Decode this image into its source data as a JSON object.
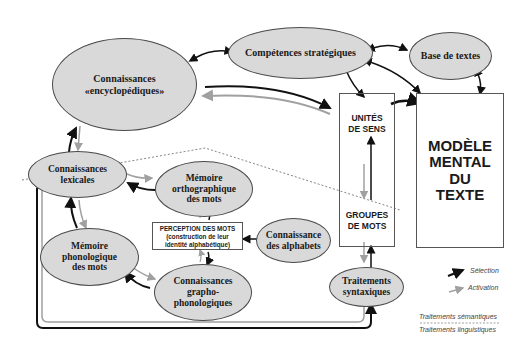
{
  "nodes": {
    "encyclopedic": {
      "line1": "Connaissances",
      "line2": "«encyclopédiques»"
    },
    "strategic": {
      "label": "Compétences stratégiques"
    },
    "text_base": {
      "label": "Base de textes"
    },
    "lexical": {
      "line1": "Connaissances",
      "line2": "lexicales"
    },
    "ortho_memory": {
      "line1": "Mémoire",
      "line2": "orthographique",
      "line3": "des mots"
    },
    "phono_memory": {
      "line1": "Mémoire",
      "line2": "phonologique",
      "line3": "des mots"
    },
    "grapho": {
      "line1": "Connaissances",
      "line2": "grapho-",
      "line3": "phonologiques"
    },
    "alphabets": {
      "line1": "Connaissance",
      "line2": "des alphabets"
    },
    "syntax": {
      "line1": "Traitements",
      "line2": "syntaxiques"
    },
    "perception": {
      "title": "PERCEPTION DES MOTS",
      "sub1": "(construction de leur",
      "sub2": "identité alphabétique)"
    },
    "meaning_units": {
      "line1": "UNITÉS",
      "line2": "DE SENS"
    },
    "word_groups": {
      "line1": "GROUPES",
      "line2": "DE MOTS"
    },
    "mental_model": {
      "line1": "MODÈLE",
      "line2": "MENTAL",
      "line3": "DU",
      "line4": "TEXTE"
    }
  },
  "legend": {
    "selection": "Sélection",
    "activation": "Activation",
    "semantic": "Traitements sémantiques",
    "linguistic": "Traitements linguistiques"
  },
  "colors": {
    "selection_arrow": "#111111",
    "activation_arrow": "#a0a0a0",
    "ellipse_fill": "#d9d9d9",
    "dashed_boundary": "#666666"
  }
}
